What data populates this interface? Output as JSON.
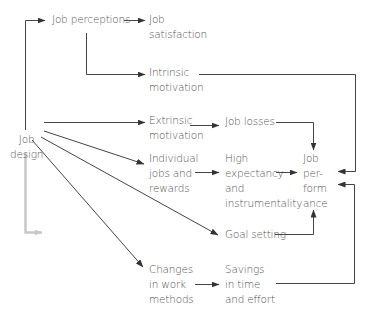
{
  "diagram": {
    "colors": {
      "line": "#444444",
      "text": "#555555",
      "faded_arrow": "#c8c8c8",
      "background": "#ffffff"
    },
    "nodes": {
      "job_design": {
        "lines": [
          "Job",
          "design"
        ]
      },
      "job_perceptions": {
        "lines": [
          "Job perceptions"
        ]
      },
      "job_satisfaction": {
        "lines": [
          "Job",
          "satisfaction"
        ]
      },
      "intrinsic_motivation": {
        "lines": [
          "Intrinsic",
          "motivation"
        ]
      },
      "extrinsic_motivation": {
        "lines": [
          "Extrinsic",
          "motivation"
        ]
      },
      "job_losses": {
        "lines": [
          "Job losses"
        ]
      },
      "individual_jobs": {
        "lines": [
          "Individual",
          "jobs and",
          "rewards"
        ]
      },
      "high_expectancy": {
        "lines": [
          "High",
          "expectancy",
          "and",
          "instrumentality"
        ]
      },
      "job_performance": {
        "lines": [
          "Job",
          "per-",
          "form",
          "ance"
        ]
      },
      "goal_setting": {
        "lines": [
          "Goal setting"
        ]
      },
      "changes_work_methods": {
        "lines": [
          "Changes",
          "in work",
          "methods"
        ]
      },
      "savings_time_effort": {
        "lines": [
          "Savings",
          "in time",
          "and effort"
        ]
      }
    },
    "edges": [
      {
        "from": "Job design",
        "to": "Job perceptions"
      },
      {
        "from": "Job perceptions",
        "to": "Job satisfaction"
      },
      {
        "from": "Job perceptions",
        "to": "Intrinsic motivation"
      },
      {
        "from": "Job design",
        "to": "Extrinsic motivation"
      },
      {
        "from": "Job design",
        "to": "Individual jobs and rewards"
      },
      {
        "from": "Job design",
        "to": "Goal setting"
      },
      {
        "from": "Job design",
        "to": "Changes in work methods"
      },
      {
        "from": "Extrinsic motivation",
        "to": "Job losses"
      },
      {
        "from": "Individual jobs and rewards",
        "to": "High expectancy and instrumentality"
      },
      {
        "from": "Changes in work methods",
        "to": "Savings in time and effort"
      },
      {
        "from": "Intrinsic motivation",
        "to": "Job performance"
      },
      {
        "from": "Job losses",
        "to": "Job performance"
      },
      {
        "from": "High expectancy and instrumentality",
        "to": "Job performance"
      },
      {
        "from": "Goal setting",
        "to": "Job performance"
      },
      {
        "from": "Savings in time and effort",
        "to": "Job performance"
      }
    ]
  }
}
